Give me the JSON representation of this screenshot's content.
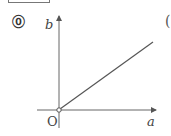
{
  "figure": {
    "marker": "⓪",
    "next_marker_partial": "(",
    "axes": {
      "y_label": "b",
      "x_label": "a",
      "origin_label": "O"
    },
    "line": {
      "description": "Straight line starting at origin (open circle, origin excluded) increasing to the upper right",
      "start": [
        0,
        0
      ],
      "start_open": true,
      "color": "#555555"
    }
  }
}
